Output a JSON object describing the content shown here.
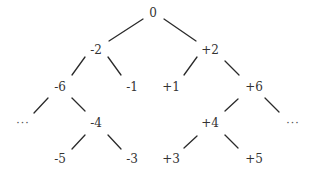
{
  "diagram": {
    "type": "tree",
    "nodes": [
      {
        "id": "n0",
        "label": "0",
        "x": 153,
        "y": 13
      },
      {
        "id": "nm2",
        "label": "-2",
        "x": 96,
        "y": 50
      },
      {
        "id": "np2",
        "label": "+2",
        "x": 210,
        "y": 50
      },
      {
        "id": "nm6",
        "label": "-6",
        "x": 60,
        "y": 87
      },
      {
        "id": "nm1",
        "label": "-1",
        "x": 132,
        "y": 87
      },
      {
        "id": "np1",
        "label": "+1",
        "x": 171,
        "y": 87
      },
      {
        "id": "np6",
        "label": "+6",
        "x": 254,
        "y": 87
      },
      {
        "id": "ellL",
        "label": "···",
        "x": 23,
        "y": 123
      },
      {
        "id": "nm4",
        "label": "-4",
        "x": 96,
        "y": 123
      },
      {
        "id": "np4",
        "label": "+4",
        "x": 210,
        "y": 123
      },
      {
        "id": "ellR",
        "label": "···",
        "x": 293,
        "y": 123
      },
      {
        "id": "nm5",
        "label": "-5",
        "x": 60,
        "y": 159
      },
      {
        "id": "nm3",
        "label": "-3",
        "x": 132,
        "y": 159
      },
      {
        "id": "np3",
        "label": "+3",
        "x": 171,
        "y": 159
      },
      {
        "id": "np5",
        "label": "+5",
        "x": 254,
        "y": 159
      }
    ],
    "edges": [
      {
        "from": "0",
        "to": "-2",
        "x1": 143,
        "y1": 19,
        "x2": 109,
        "y2": 41
      },
      {
        "from": "0",
        "to": "+2",
        "x1": 164,
        "y1": 19,
        "x2": 196,
        "y2": 41
      },
      {
        "from": "-2",
        "to": "-6",
        "x1": 85,
        "y1": 57,
        "x2": 72,
        "y2": 75
      },
      {
        "from": "-2",
        "to": "-1",
        "x1": 108,
        "y1": 57,
        "x2": 121,
        "y2": 75
      },
      {
        "from": "+2",
        "to": "+1",
        "x1": 197,
        "y1": 57,
        "x2": 184,
        "y2": 75
      },
      {
        "from": "+2",
        "to": "+6",
        "x1": 225,
        "y1": 61,
        "x2": 239,
        "y2": 75
      },
      {
        "from": "-6",
        "to": "...",
        "x1": 48,
        "y1": 98,
        "x2": 34,
        "y2": 113
      },
      {
        "from": "-6",
        "to": "-4",
        "x1": 72,
        "y1": 98,
        "x2": 85,
        "y2": 111
      },
      {
        "from": "+6",
        "to": "+4",
        "x1": 238,
        "y1": 99,
        "x2": 225,
        "y2": 111
      },
      {
        "from": "+6",
        "to": "...",
        "x1": 265,
        "y1": 98,
        "x2": 279,
        "y2": 112
      },
      {
        "from": "-4",
        "to": "-5",
        "x1": 85,
        "y1": 135,
        "x2": 72,
        "y2": 149
      },
      {
        "from": "-4",
        "to": "-3",
        "x1": 108,
        "y1": 135,
        "x2": 121,
        "y2": 149
      },
      {
        "from": "+4",
        "to": "+3",
        "x1": 197,
        "y1": 136,
        "x2": 184,
        "y2": 148
      },
      {
        "from": "+4",
        "to": "+5",
        "x1": 225,
        "y1": 135,
        "x2": 238,
        "y2": 148
      }
    ]
  }
}
